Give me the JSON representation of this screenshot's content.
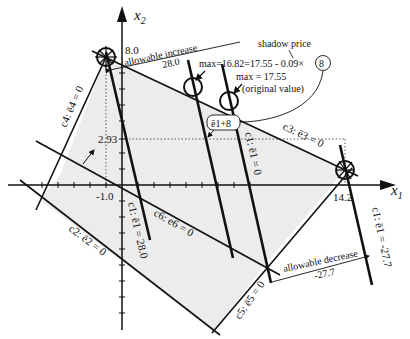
{
  "axes": {
    "x_label": "x",
    "x_sub": "1",
    "y_label": "x",
    "y_sub": "2",
    "ticks": {
      "x_neg": "-1.0",
      "x_pos": "14.2",
      "y_top": "8.0",
      "y_mid": "2.93"
    }
  },
  "constraints": {
    "c1_original": "c1: ē1 = 0",
    "c1_increase": "c1: ē1 = 28.0",
    "c1_decrease": "c1: ē1 = -27.7",
    "c2": "c2: ē2 = 0",
    "c3": "c3: ē3 = 0",
    "c4": "c4: ē4 = 0",
    "c5": "c5: ē5 = 0",
    "c6": "c6: e6 = 0"
  },
  "annotations": {
    "allowable_increase_label": "allowable increase",
    "allowable_increase_value": "28.0",
    "allowable_decrease_label": "allowable decrease",
    "allowable_decrease_value": "-27.7",
    "shadow_price_label": "shadow price",
    "max_new": "max=16.82=17.55 - 0.09×",
    "max_new_circled": "8",
    "max_original": "max = 17.55",
    "original_value": "(original value)",
    "e1_plus": "ē1+8"
  },
  "colors": {
    "line": "#111111",
    "feasible_fill": "#ececec",
    "background": "#ffffff"
  }
}
